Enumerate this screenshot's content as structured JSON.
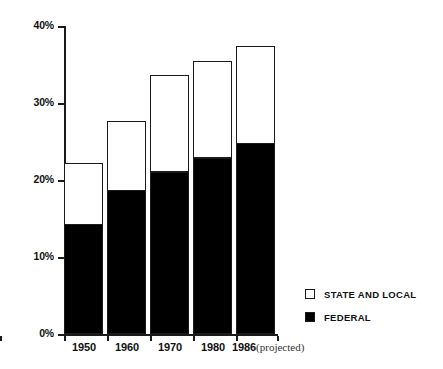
{
  "chart_data": {
    "type": "bar",
    "subtype": "stacked",
    "title": "",
    "subtitle": "",
    "xlabel": "",
    "ylabel": "",
    "categories": [
      "1950",
      "1960",
      "1970",
      "1980",
      "1986"
    ],
    "category_notes": [
      "",
      "",
      "",
      "",
      "(projected)"
    ],
    "series": [
      {
        "name": "FEDERAL",
        "color": "#000000",
        "values": [
          14.0,
          18.4,
          20.8,
          22.6,
          24.5
        ]
      },
      {
        "name": "STATE AND LOCAL",
        "color": "#ffffff",
        "values": [
          8.2,
          9.3,
          12.8,
          12.8,
          12.9
        ]
      }
    ],
    "totals": [
      22.2,
      27.7,
      33.6,
      35.4,
      37.4
    ],
    "ylim": [
      0,
      40
    ],
    "yticks": [
      0,
      10,
      20,
      30,
      40
    ],
    "ytick_labels": [
      "0%",
      "10%",
      "20%",
      "30%",
      "40%"
    ],
    "grid": false,
    "legend_position": "right-bottom",
    "value_unit": "%"
  },
  "axes": {
    "y": {
      "ticks": [
        {
          "label": "40%",
          "value": 40
        },
        {
          "label": "30%",
          "value": 30
        },
        {
          "label": "20%",
          "value": 20
        },
        {
          "label": "10%",
          "value": 10
        },
        {
          "label": "0%",
          "value": 0
        }
      ]
    },
    "x": {
      "labels": [
        {
          "label": "1950",
          "note": ""
        },
        {
          "label": "1960",
          "note": ""
        },
        {
          "label": "1970",
          "note": ""
        },
        {
          "label": "1980",
          "note": ""
        },
        {
          "label": "1986",
          "note": "(projected)"
        }
      ]
    }
  },
  "legend": {
    "items": [
      {
        "label": "STATE AND LOCAL",
        "swatch": "open-square",
        "color": "#ffffff"
      },
      {
        "label": "FEDERAL",
        "swatch": "filled-square",
        "color": "#000000"
      }
    ]
  }
}
